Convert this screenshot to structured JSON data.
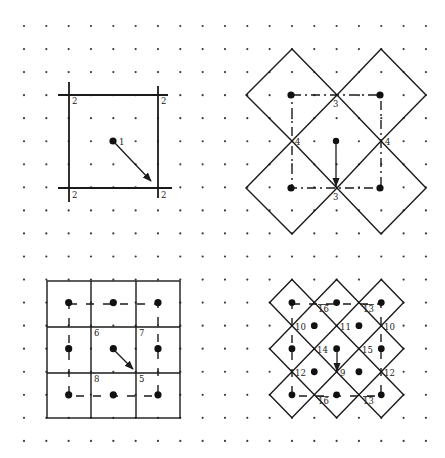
{
  "diagram": {
    "lattice": {
      "columns": 19,
      "rows": 19
    },
    "panels": [
      {
        "id": "top-left",
        "shape": "square",
        "labels": [
          {
            "text": "1",
            "role": "center-point"
          },
          {
            "text": "2",
            "role": "corner-top-left"
          },
          {
            "text": "2",
            "role": "corner-top-right"
          },
          {
            "text": "2",
            "role": "corner-bottom-left"
          },
          {
            "text": "2",
            "role": "corner-bottom-right"
          }
        ],
        "arrow": "center to bottom-right corner"
      },
      {
        "id": "top-right",
        "shape": "four rotated squares (diamonds)",
        "labels": [
          {
            "text": "3",
            "role": "top-crossing"
          },
          {
            "text": "4",
            "role": "left-crossing"
          },
          {
            "text": "4",
            "role": "right-crossing"
          },
          {
            "text": "3",
            "role": "bottom-crossing"
          }
        ],
        "arrow": "center point straight down"
      },
      {
        "id": "bottom-left",
        "shape": "3x3 square grid",
        "labels": [
          {
            "text": "6",
            "role": "inner-top-left"
          },
          {
            "text": "7",
            "role": "inner-top-right"
          },
          {
            "text": "8",
            "role": "inner-bottom-left"
          },
          {
            "text": "5",
            "role": "inner-bottom-right"
          }
        ],
        "arrow": "center to inner bottom-right corner"
      },
      {
        "id": "bottom-right",
        "shape": "3x3 diamond grid",
        "labels": [
          {
            "text": "16",
            "role": "top-left-edge",
            "overline": true
          },
          {
            "text": "13",
            "role": "top-right-edge",
            "overline": true
          },
          {
            "text": "10",
            "role": "left-upper"
          },
          {
            "text": "11",
            "role": "center-upper"
          },
          {
            "text": "10",
            "role": "right-upper"
          },
          {
            "text": "14",
            "role": "inner-left"
          },
          {
            "text": "15",
            "role": "inner-right"
          },
          {
            "text": "12",
            "role": "left-lower"
          },
          {
            "text": "9",
            "role": "center-lower"
          },
          {
            "text": "12",
            "role": "right-lower"
          },
          {
            "text": "16",
            "role": "bottom-left-edge",
            "overline": true
          },
          {
            "text": "13",
            "role": "bottom-right-edge",
            "overline": true
          }
        ],
        "arrow": "center point straight down"
      }
    ]
  },
  "colors": {
    "ink": "#1a1a1a",
    "background": "#ffffff",
    "dot": "#3a3a3a"
  }
}
